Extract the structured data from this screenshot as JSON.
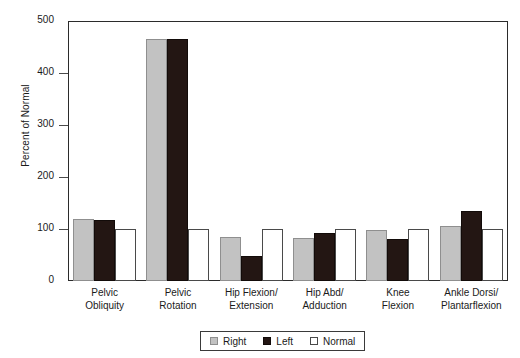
{
  "chart_data": {
    "type": "bar",
    "title": "",
    "xlabel": "",
    "ylabel": "Percent of Normal",
    "ylim": [
      0,
      500
    ],
    "yticks": [
      0,
      100,
      200,
      300,
      400,
      500
    ],
    "ytick_labels": [
      "0",
      "100",
      "200",
      "300",
      "400",
      "500"
    ],
    "grid": false,
    "legend_position": "bottom-right",
    "categories": [
      "Pelvic Obliquity",
      "Pelvic Rotation",
      "Hip Flexion/Extension",
      "Hip Abd/Adduction",
      "Knee Flexion",
      "Ankle Dorsi/Plantarflexion"
    ],
    "category_lines": [
      [
        "Pelvic",
        "Obliquity"
      ],
      [
        "Pelvic",
        "Rotation"
      ],
      [
        "Hip Flexion/",
        "Extension"
      ],
      [
        "Hip Abd/",
        "Adduction"
      ],
      [
        "Knee",
        "Flexion"
      ],
      [
        "Ankle Dorsi/",
        "Plantarflexion"
      ]
    ],
    "series": [
      {
        "name": "Right",
        "color": "#c2c2c2",
        "values": [
          119,
          465,
          85,
          83,
          98,
          105
        ]
      },
      {
        "name": "Left",
        "color": "#231613",
        "values": [
          118,
          465,
          48,
          92,
          81,
          135
        ]
      },
      {
        "name": "Normal",
        "color": "#ffffff",
        "values": [
          100,
          100,
          100,
          100,
          100,
          100
        ]
      }
    ]
  },
  "legend": {
    "items": [
      {
        "label": "Right",
        "swatch": "gray-swatch"
      },
      {
        "label": "Left",
        "swatch": "black-swatch"
      },
      {
        "label": "Normal",
        "swatch": "white-swatch"
      }
    ]
  },
  "axis": {
    "y_title": "Percent of Normal"
  }
}
